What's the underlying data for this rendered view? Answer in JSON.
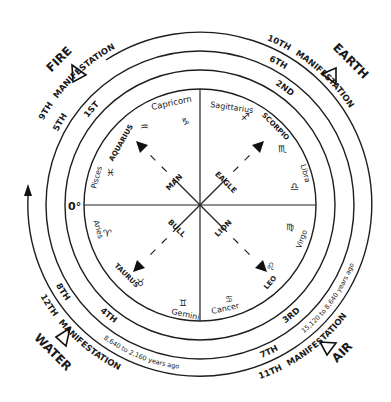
{
  "elements": {
    "fire": "FIRE",
    "earth": "EARTH",
    "water": "WATER",
    "air": "AIR"
  },
  "manifestations": {
    "upper_left": {
      "outer": "9TH",
      "word": "MANIFESTATION",
      "middle": "5TH",
      "inner": "1ST"
    },
    "upper_right": {
      "outer": "10TH",
      "word": "MANIFESTATION",
      "middle": "6TH",
      "inner": "2ND"
    },
    "lower_left": {
      "outer": "12TH",
      "word": "MANIFESTATION",
      "middle": "8TH",
      "inner": "4TH",
      "years": "8,640 to 2,160 years ago"
    },
    "lower_right": {
      "outer": "11TH",
      "word": "MANIFESTATION",
      "middle": "7TH",
      "inner": "3RD",
      "years": "15,120 to 8,640 years ago"
    }
  },
  "zero_degree": "0°",
  "signs": {
    "capricorn": {
      "name": "Capricorn",
      "glyph": "♑"
    },
    "aquarius": {
      "name": "AQUARIUS",
      "glyph": "♒"
    },
    "pisces": {
      "name": "Pisces",
      "glyph": "♓"
    },
    "aries": {
      "name": "Aries",
      "glyph": "♈"
    },
    "taurus": {
      "name": "TAURUS",
      "glyph": "♉"
    },
    "gemini": {
      "name": "Gemini",
      "glyph": "♊"
    },
    "cancer": {
      "name": "Cancer",
      "glyph": "♋"
    },
    "leo": {
      "name": "LEO",
      "glyph": "♌"
    },
    "virgo": {
      "name": "Virgo",
      "glyph": "♍"
    },
    "libra": {
      "name": "Libra",
      "glyph": "♎"
    },
    "scorpio": {
      "name": "SCORPIO",
      "glyph": "♏"
    },
    "sagittarius": {
      "name": "Sagittarius",
      "glyph": "♐"
    }
  },
  "fixed_figures": {
    "man": "MAN",
    "eagle": "EAGLE",
    "bull": "BULL",
    "lion": "LION"
  }
}
